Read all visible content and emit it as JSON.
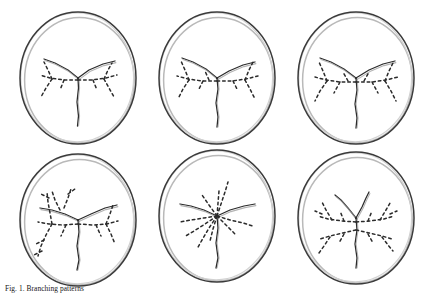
{
  "figure": {
    "caption_label": "Fig. 1.",
    "caption_text": "Fig. 1. Growth patterns of mycelial networks on agar plates.",
    "caption_visible_fragment": "Fig. 1. Branching patterns",
    "background_color": "#ffffff",
    "ink_color": "#2b2b2b",
    "rim_outer_color": "#3a3a3a",
    "rim_inner_color": "#b9b9b9",
    "dish_fill_color": "#ffffff",
    "panel_count": 6,
    "grid_rows": 2,
    "grid_columns": 3
  },
  "panels": [
    {
      "id": "panel-1",
      "name": "petri-dish-top-left",
      "row": 0,
      "column": 0,
      "x": 8,
      "y": 6,
      "pattern": "tri-radiate-with-lateral-dashed-branches",
      "center_x": 70,
      "center_y": 72,
      "radius_x": 58,
      "radius_y": 66,
      "trunk": "M70,72 L70.5,82 L69,96 L70.5,110 L69.5,120",
      "arms": [
        "M70,72 L60,64 L47,57 L36,53",
        "M70,72 L81,64 L95,58 L107,55"
      ],
      "dashed_branches": [
        "M70,74 L56,74 L42,72 L32,69",
        "M70,74 L84,74 L98,72 L109,69",
        "M44,73 L38,82 L33,91",
        "M44,73 L40,64 L36,56",
        "M96,73 L101,82 L106,91",
        "M96,73 L100,64 L104,57",
        "M56,74 L52,84",
        "M85,74 L89,84"
      ]
    },
    {
      "id": "panel-2",
      "name": "petri-dish-top-middle",
      "row": 0,
      "column": 1,
      "x": 147,
      "y": 6,
      "pattern": "tri-radiate-with-lateral-dashed-branches",
      "center_x": 70,
      "center_y": 72,
      "radius_x": 58,
      "radius_y": 66,
      "trunk": "M70,72 L71,83 L69,97 L71,111 L70,121",
      "arms": [
        "M70,72 L59,63 L46,56 L35,52",
        "M70,72 L82,65 L96,59 L108,56"
      ],
      "dashed_branches": [
        "M70,75 L55,75 L41,73 L30,70",
        "M70,75 L85,75 L99,73 L111,70",
        "M42,74 L36,83 L31,93",
        "M42,74 L38,64 L34,55",
        "M98,74 L103,83 L108,93",
        "M98,74 L102,64 L106,56",
        "M56,75 L51,85",
        "M86,75 L91,85",
        "M62,74 L58,65"
      ]
    },
    {
      "id": "panel-3",
      "name": "petri-dish-top-right",
      "row": 0,
      "column": 2,
      "x": 286,
      "y": 6,
      "pattern": "tri-radiate-with-lateral-dashed-branches",
      "center_x": 70,
      "center_y": 72,
      "radius_x": 58,
      "radius_y": 66,
      "trunk": "M70,72 L71,84 L69,98 L71,112 L70,122",
      "arms": [
        "M70,72 L58,63 L45,56 L34,52",
        "M70,72 L83,64 L97,58 L109,55"
      ],
      "dashed_branches": [
        "M70,76 L54,76 L40,74 L29,71",
        "M70,76 L86,76 L100,74 L112,71",
        "M41,75 L34,85 L29,95",
        "M41,75 L37,65 L33,56",
        "M99,75 L105,85 L110,95",
        "M99,75 L103,65 L107,57",
        "M54,76 L48,87",
        "M86,76 L92,87",
        "M62,75 L57,66",
        "M78,75 L83,66"
      ]
    },
    {
      "id": "panel-4",
      "name": "petri-dish-bottom-left",
      "row": 1,
      "column": 0,
      "x": 8,
      "y": 148,
      "pattern": "dense-asymmetric-dashed-branching",
      "center_x": 70,
      "center_y": 72,
      "radius_x": 58,
      "radius_y": 66,
      "trunk": "M70,72 L71,84 L69,98 L71,112 L69,122",
      "arms": [
        "M70,72 L57,66 L44,62 L32,60",
        "M70,72 L83,66 L97,60 L109,57"
      ],
      "dashed_branches": [
        "M70,76 L55,77 L41,76 L30,74",
        "M70,76 L85,77 L99,76 L110,73",
        "M44,76 L38,87 L33,98 L30,108",
        "M44,76 L42,65 L40,54 L39,44",
        "M52,62 L47,52 L44,43",
        "M56,60 L60,50 L63,41",
        "M98,76 L103,86 L107,96",
        "M98,76 L102,66 L105,57",
        "M36,92 L28,96",
        "M34,103 L26,107",
        "M41,50 L33,46",
        "M60,46 L67,41",
        "M88,77 L93,88",
        "M58,77 L53,88"
      ]
    },
    {
      "id": "panel-5",
      "name": "petri-dish-bottom-middle",
      "row": 1,
      "column": 1,
      "x": 147,
      "y": 148,
      "pattern": "radial-starburst-dashed-rays",
      "center_x": 70,
      "center_y": 68,
      "radius_x": 58,
      "radius_y": 66,
      "trunk": "M70,68 L71,80 L69,95 L71,110 L69,120",
      "arms": [
        "M70,68 L57,62 L44,58 L33,56",
        "M70,68 L83,62 L97,58 L108,56"
      ],
      "dashed_branches": [
        "M70,68 L74,56 L78,44 L81,34",
        "M70,68 L71,55 L72,43",
        "M70,68 L62,57 L55,47",
        "M70,68 L57,70 L44,72 L33,74",
        "M70,68 L58,76 L47,83 L37,89",
        "M70,68 L62,80 L55,92 L50,101",
        "M70,68 L83,72 L96,75 L106,78",
        "M70,68 L80,78 L89,87",
        "M70,68 L66,81 L63,93"
      ]
    },
    {
      "id": "panel-6",
      "name": "petri-dish-bottom-right",
      "row": 1,
      "column": 2,
      "x": 286,
      "y": 148,
      "pattern": "bilateral-dashed-fan-branching",
      "center_x": 70,
      "center_y": 70,
      "radius_x": 58,
      "radius_y": 66,
      "trunk": "M70,70 L71,82 L69,96 L71,110 L70,120",
      "arms": [
        "M70,70 L62,60 L55,52 L49,47",
        "M70,70 L76,59 L80,50 L83,44"
      ],
      "dashed_branches": [
        "M70,74 L56,73 L42,71 L32,68",
        "M70,74 L84,73 L98,71 L108,68",
        "M70,82 L57,85 L44,88 L34,91",
        "M70,82 L83,85 L96,88 L106,91",
        "M46,72 L40,62 L36,54",
        "M94,72 L100,62 L104,55",
        "M44,89 L38,98 L33,105",
        "M96,89 L102,97 L107,103",
        "M58,73 L54,63",
        "M82,73 L86,63",
        "M58,86 L53,95",
        "M82,86 L87,95",
        "M36,66 L29,63",
        "M104,66 L111,63"
      ]
    }
  ]
}
